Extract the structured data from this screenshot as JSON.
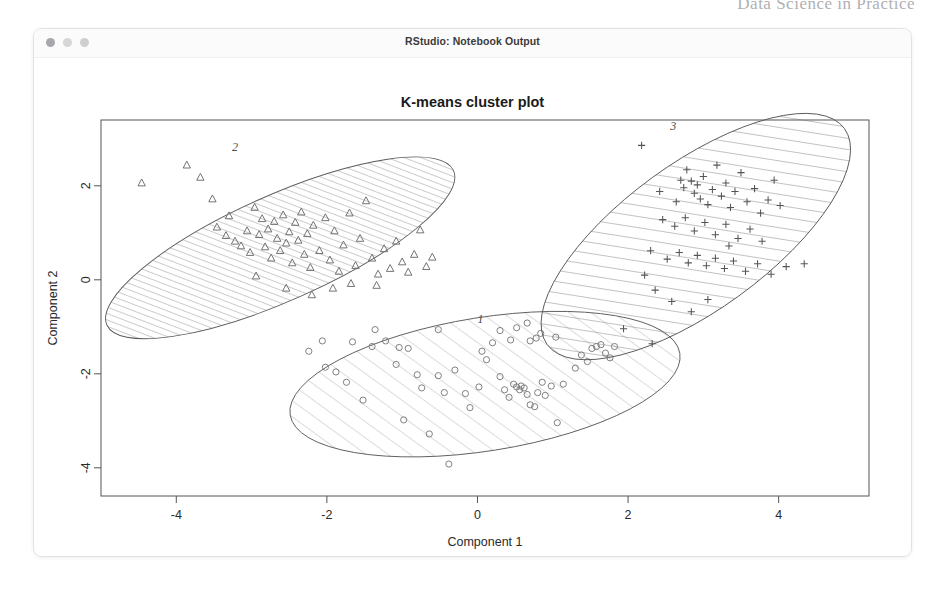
{
  "page": {
    "running_header": "Data Science in Practice",
    "folio": ""
  },
  "window": {
    "title": "RStudio: Notebook Output",
    "traffic_lights": [
      "close-dot",
      "minimize-dot",
      "zoom-dot"
    ]
  },
  "chart_data": {
    "type": "scatter",
    "title": "K-means cluster plot",
    "xlabel": "Component 1",
    "ylabel": "Component 2",
    "caption": "These two components explain 57.38 % of the point variability.",
    "variance_explained_pct": 57.38,
    "xlim": [
      -5.0,
      5.2
    ],
    "ylim": [
      -4.6,
      3.4
    ],
    "xticks": [
      -4,
      -2,
      0,
      2,
      4
    ],
    "yticks": [
      2,
      0,
      -2,
      -4
    ],
    "xtick_labels": [
      "-4",
      "-2",
      "0",
      "2",
      "4"
    ],
    "ytick_labels": [
      "2",
      "0",
      "-2",
      "-4"
    ],
    "grid": false,
    "legend": "none",
    "cluster_labels_inline": [
      "1",
      "2",
      "3"
    ],
    "clusters": [
      {
        "name": "1",
        "label": "1",
        "marker": "circle",
        "hatch": "wide-diagonal",
        "hatch_spacing_px": 13,
        "color": "#7a7a7a",
        "ellipse": {
          "cx": 0.1,
          "cy": -2.22,
          "rx": 2.62,
          "ry": 1.42,
          "rotation_deg": -9
        },
        "label_pos": {
          "x": 0.04,
          "y": -0.92
        },
        "n_points": 62,
        "points": [
          [
            -0.38,
            -3.92
          ],
          [
            -0.64,
            -3.28
          ],
          [
            -0.98,
            -2.98
          ],
          [
            -1.52,
            -2.56
          ],
          [
            -1.74,
            -2.18
          ],
          [
            -2.02,
            -1.86
          ],
          [
            -2.24,
            -1.52
          ],
          [
            -2.06,
            -1.3
          ],
          [
            -1.66,
            -1.32
          ],
          [
            -1.4,
            -1.42
          ],
          [
            -1.22,
            -1.3
          ],
          [
            -1.04,
            -1.44
          ],
          [
            -0.92,
            -1.46
          ],
          [
            -1.08,
            -1.8
          ],
          [
            -0.8,
            -2.02
          ],
          [
            -0.74,
            -2.3
          ],
          [
            -0.52,
            -2.04
          ],
          [
            -0.44,
            -2.4
          ],
          [
            -0.3,
            -1.92
          ],
          [
            -0.16,
            -2.42
          ],
          [
            -0.1,
            -2.72
          ],
          [
            0.02,
            -2.28
          ],
          [
            0.06,
            -1.52
          ],
          [
            0.12,
            -1.7
          ],
          [
            0.3,
            -2.06
          ],
          [
            0.36,
            -2.34
          ],
          [
            0.42,
            -2.5
          ],
          [
            0.48,
            -2.22
          ],
          [
            0.52,
            -2.28
          ],
          [
            0.56,
            -2.34
          ],
          [
            0.58,
            -2.26
          ],
          [
            0.62,
            -2.3
          ],
          [
            0.66,
            -2.44
          ],
          [
            0.7,
            -2.66
          ],
          [
            0.76,
            -2.7
          ],
          [
            0.8,
            -2.4
          ],
          [
            0.86,
            -2.18
          ],
          [
            0.9,
            -2.46
          ],
          [
            0.98,
            -2.26
          ],
          [
            1.06,
            -3.04
          ],
          [
            1.14,
            -2.22
          ],
          [
            1.3,
            -1.88
          ],
          [
            1.38,
            -1.6
          ],
          [
            1.46,
            -1.74
          ],
          [
            1.52,
            -1.46
          ],
          [
            1.58,
            -1.42
          ],
          [
            1.64,
            -1.38
          ],
          [
            1.7,
            -1.56
          ],
          [
            1.76,
            -1.66
          ],
          [
            1.82,
            -1.42
          ],
          [
            0.44,
            -1.28
          ],
          [
            0.7,
            -1.3
          ],
          [
            0.78,
            -1.24
          ],
          [
            0.3,
            -1.08
          ],
          [
            0.52,
            -1.02
          ],
          [
            0.66,
            -0.92
          ],
          [
            0.84,
            -1.14
          ],
          [
            1.04,
            -1.22
          ],
          [
            -0.52,
            -1.06
          ],
          [
            -1.36,
            -1.06
          ],
          [
            0.2,
            -1.34
          ],
          [
            -1.88,
            -1.96
          ]
        ]
      },
      {
        "name": "2",
        "label": "2",
        "marker": "triangle",
        "hatch": "dense-diagonal",
        "hatch_spacing_px": 6,
        "color": "#6d6d6d",
        "ellipse": {
          "cx": -2.62,
          "cy": 0.68,
          "rx": 2.52,
          "ry": 1.12,
          "rotation_deg": -24
        },
        "label_pos": {
          "x": -3.22,
          "y": 2.74
        },
        "n_points": 58,
        "points": [
          [
            -4.46,
            2.06
          ],
          [
            -3.86,
            2.44
          ],
          [
            -3.68,
            2.18
          ],
          [
            -3.52,
            1.72
          ],
          [
            -3.46,
            1.12
          ],
          [
            -3.34,
            0.94
          ],
          [
            -3.3,
            1.36
          ],
          [
            -3.22,
            0.82
          ],
          [
            -3.14,
            0.72
          ],
          [
            -3.06,
            1.04
          ],
          [
            -3.02,
            0.58
          ],
          [
            -2.96,
            1.54
          ],
          [
            -2.9,
            0.96
          ],
          [
            -2.86,
            1.3
          ],
          [
            -2.82,
            0.7
          ],
          [
            -2.78,
            1.08
          ],
          [
            -2.74,
            0.46
          ],
          [
            -2.7,
            1.24
          ],
          [
            -2.66,
            0.88
          ],
          [
            -2.62,
            0.62
          ],
          [
            -2.58,
            1.38
          ],
          [
            -2.54,
            0.78
          ],
          [
            -2.5,
            1.02
          ],
          [
            -2.46,
            0.36
          ],
          [
            -2.42,
            1.22
          ],
          [
            -2.38,
            0.84
          ],
          [
            -2.34,
            1.44
          ],
          [
            -2.3,
            0.54
          ],
          [
            -2.26,
            0.98
          ],
          [
            -2.22,
            0.26
          ],
          [
            -2.18,
            1.16
          ],
          [
            -2.1,
            0.62
          ],
          [
            -2.02,
            1.32
          ],
          [
            -1.96,
            0.42
          ],
          [
            -1.9,
            1.04
          ],
          [
            -1.84,
            0.18
          ],
          [
            -1.78,
            0.74
          ],
          [
            -1.7,
            1.42
          ],
          [
            -1.62,
            0.3
          ],
          [
            -1.56,
            0.88
          ],
          [
            -1.48,
            1.68
          ],
          [
            -1.4,
            0.46
          ],
          [
            -1.32,
            0.12
          ],
          [
            -1.24,
            0.66
          ],
          [
            -1.16,
            0.24
          ],
          [
            -1.08,
            0.82
          ],
          [
            -1.0,
            0.38
          ],
          [
            -0.92,
            0.16
          ],
          [
            -0.84,
            0.54
          ],
          [
            -0.76,
            1.06
          ],
          [
            -0.68,
            0.28
          ],
          [
            -0.6,
            0.48
          ],
          [
            -2.94,
            0.08
          ],
          [
            -2.54,
            -0.18
          ],
          [
            -2.2,
            -0.32
          ],
          [
            -1.92,
            -0.18
          ],
          [
            -1.68,
            -0.08
          ],
          [
            -1.34,
            -0.12
          ]
        ]
      },
      {
        "name": "3",
        "label": "3",
        "marker": "plus",
        "hatch": "medium-diagonal",
        "hatch_spacing_px": 11,
        "color": "#555555",
        "ellipse": {
          "cx": 2.9,
          "cy": 0.92,
          "rx": 2.44,
          "ry": 1.56,
          "rotation_deg": -36
        },
        "label_pos": {
          "x": 2.6,
          "y": 3.18
        },
        "n_points": 57,
        "points": [
          [
            2.18,
            2.86
          ],
          [
            2.42,
            1.88
          ],
          [
            2.64,
            1.66
          ],
          [
            2.7,
            2.12
          ],
          [
            2.74,
            1.96
          ],
          [
            2.78,
            2.34
          ],
          [
            2.84,
            2.1
          ],
          [
            2.88,
            1.84
          ],
          [
            2.92,
            2.02
          ],
          [
            2.96,
            1.72
          ],
          [
            3.0,
            2.2
          ],
          [
            3.06,
            1.6
          ],
          [
            3.12,
            1.92
          ],
          [
            3.18,
            2.44
          ],
          [
            3.24,
            1.78
          ],
          [
            3.3,
            2.06
          ],
          [
            3.36,
            1.54
          ],
          [
            3.42,
            1.88
          ],
          [
            3.5,
            2.28
          ],
          [
            3.58,
            1.66
          ],
          [
            3.68,
            1.94
          ],
          [
            3.76,
            1.42
          ],
          [
            3.86,
            1.7
          ],
          [
            3.94,
            2.12
          ],
          [
            4.02,
            1.58
          ],
          [
            2.46,
            1.28
          ],
          [
            2.62,
            1.14
          ],
          [
            2.76,
            1.32
          ],
          [
            2.88,
            1.04
          ],
          [
            3.02,
            1.22
          ],
          [
            3.16,
            0.96
          ],
          [
            3.3,
            1.18
          ],
          [
            3.46,
            0.88
          ],
          [
            3.62,
            1.08
          ],
          [
            3.78,
            0.82
          ],
          [
            2.3,
            0.62
          ],
          [
            2.52,
            0.44
          ],
          [
            2.68,
            0.58
          ],
          [
            2.8,
            0.36
          ],
          [
            2.92,
            0.52
          ],
          [
            3.04,
            0.3
          ],
          [
            3.16,
            0.46
          ],
          [
            3.28,
            0.24
          ],
          [
            3.4,
            0.4
          ],
          [
            3.56,
            0.18
          ],
          [
            3.72,
            0.34
          ],
          [
            3.9,
            0.12
          ],
          [
            4.1,
            0.28
          ],
          [
            4.34,
            0.34
          ],
          [
            2.22,
            0.1
          ],
          [
            2.36,
            -0.22
          ],
          [
            2.58,
            -0.46
          ],
          [
            2.84,
            -0.68
          ],
          [
            3.06,
            -0.42
          ],
          [
            1.94,
            -1.04
          ],
          [
            2.32,
            -1.36
          ],
          [
            3.34,
            0.72
          ]
        ]
      }
    ]
  }
}
